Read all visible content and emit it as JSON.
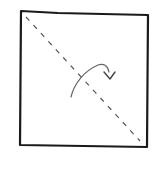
{
  "diagram": {
    "type": "origami-fold-step",
    "shape": "square",
    "fold_line": "diagonal-valley-fold",
    "fold_direction": "curved-arrow",
    "colors": {
      "background": "#ffffff",
      "outline": "#1a1a1a",
      "fold_line": "#555555",
      "arrow": "#666666"
    }
  }
}
